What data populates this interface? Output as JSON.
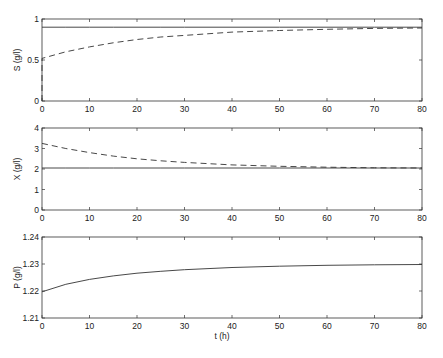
{
  "chart_data": [
    {
      "type": "line",
      "title": "",
      "xlabel": "",
      "ylabel": "S (g/l)",
      "xlim": [
        0,
        80
      ],
      "ylim": [
        0,
        1
      ],
      "xticks": [
        0,
        10,
        20,
        30,
        40,
        50,
        60,
        70,
        80
      ],
      "yticks": [
        "0",
        "0.5",
        "1"
      ],
      "ytick_values": [
        0,
        0.5,
        1
      ],
      "grid": false,
      "x": [
        0,
        5,
        10,
        15,
        20,
        25,
        30,
        40,
        50,
        60,
        70,
        80
      ],
      "series": [
        {
          "name": "solid",
          "style": "solid",
          "values": [
            0.9,
            0.9,
            0.9,
            0.9,
            0.9,
            0.9,
            0.9,
            0.9,
            0.9,
            0.9,
            0.9,
            0.9
          ]
        },
        {
          "name": "dashed",
          "style": "dashed",
          "start_drop_from": 0,
          "values": [
            0.52,
            0.6,
            0.66,
            0.71,
            0.75,
            0.78,
            0.8,
            0.84,
            0.86,
            0.875,
            0.885,
            0.89
          ]
        }
      ]
    },
    {
      "type": "line",
      "title": "",
      "xlabel": "",
      "ylabel": "X (g/l)",
      "xlim": [
        0,
        80
      ],
      "ylim": [
        0,
        4
      ],
      "xticks": [
        0,
        10,
        20,
        30,
        40,
        50,
        60,
        70,
        80
      ],
      "yticks": [
        "0",
        "1",
        "2",
        "3",
        "4"
      ],
      "ytick_values": [
        0,
        1,
        2,
        3,
        4
      ],
      "grid": false,
      "x": [
        0,
        5,
        10,
        15,
        20,
        25,
        30,
        40,
        50,
        60,
        70,
        80
      ],
      "series": [
        {
          "name": "solid",
          "style": "solid",
          "values": [
            2.05,
            2.05,
            2.05,
            2.05,
            2.05,
            2.05,
            2.05,
            2.05,
            2.05,
            2.05,
            2.05,
            2.05
          ]
        },
        {
          "name": "dashed",
          "style": "dashed",
          "values": [
            3.25,
            3.0,
            2.8,
            2.63,
            2.5,
            2.4,
            2.32,
            2.2,
            2.13,
            2.09,
            2.06,
            2.05
          ]
        }
      ]
    },
    {
      "type": "line",
      "title": "",
      "xlabel": "t (h)",
      "ylabel": "P (g/l)",
      "xlim": [
        0,
        80
      ],
      "ylim": [
        1.21,
        1.24
      ],
      "xticks": [
        0,
        10,
        20,
        30,
        40,
        50,
        60,
        70,
        80
      ],
      "yticks": [
        "1.21",
        "1.22",
        "1.23",
        "1.24"
      ],
      "ytick_values": [
        1.21,
        1.22,
        1.23,
        1.24
      ],
      "grid": false,
      "x": [
        0,
        5,
        10,
        15,
        20,
        25,
        30,
        40,
        50,
        60,
        70,
        80
      ],
      "series": [
        {
          "name": "solid",
          "style": "solid",
          "values": [
            1.2197,
            1.2225,
            1.2243,
            1.2256,
            1.2266,
            1.2273,
            1.2279,
            1.2287,
            1.2292,
            1.2295,
            1.2297,
            1.2298
          ]
        }
      ]
    }
  ]
}
